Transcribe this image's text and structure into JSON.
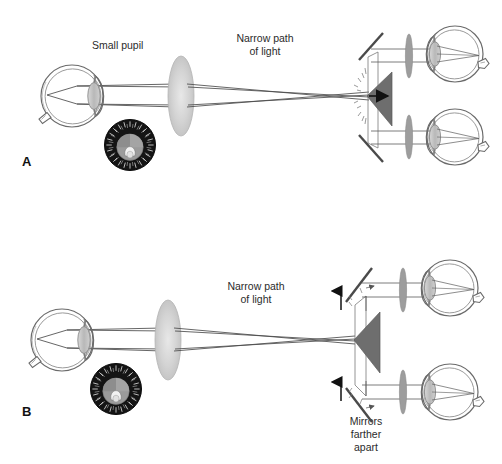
{
  "figure": {
    "background_color": "#ffffff",
    "ink_color": "#3a3a3a",
    "lens_fill": "#c9c9c9",
    "prism_fill": "#6e6e6e",
    "dial_fill": "#141414",
    "iris_fill": "#9b9b9b",
    "pupil_fill": "#f2f2f2"
  },
  "panels": [
    {
      "id": "A",
      "label": "A",
      "annotations": [
        {
          "name": "small-pupil",
          "text": "Small pupil",
          "lines": [
            "Small pupil"
          ]
        },
        {
          "name": "narrow-path-of-light",
          "text": "Narrow path of light",
          "lines": [
            "Narrow path",
            "of light"
          ]
        }
      ],
      "components": [
        {
          "name": "patient-eye",
          "label": "Patient eye"
        },
        {
          "name": "pupil-dial-inset",
          "label": "Pupil dial inset"
        },
        {
          "name": "condensing-lens",
          "label": "Condensing lens"
        },
        {
          "name": "prism",
          "label": "Prism"
        },
        {
          "name": "upper-mirror",
          "label": "Upper mirror"
        },
        {
          "name": "lower-mirror",
          "label": "Lower mirror"
        },
        {
          "name": "observer-eye-upper",
          "label": "Observer eye upper"
        },
        {
          "name": "observer-eye-lower",
          "label": "Observer eye lower"
        }
      ]
    },
    {
      "id": "B",
      "label": "B",
      "annotations": [
        {
          "name": "narrow-path-of-light",
          "text": "Narrow path of light",
          "lines": [
            "Narrow path",
            "of light"
          ]
        },
        {
          "name": "mirrors-farther-apart",
          "text": "Mirrors farther apart",
          "lines": [
            "Mirrors",
            "farther",
            "apart"
          ]
        }
      ],
      "components": [
        {
          "name": "patient-eye",
          "label": "Patient eye"
        },
        {
          "name": "pupil-dial-inset",
          "label": "Pupil dial inset"
        },
        {
          "name": "condensing-lens",
          "label": "Condensing lens"
        },
        {
          "name": "prism",
          "label": "Prism"
        },
        {
          "name": "upper-mirror",
          "label": "Upper mirror"
        },
        {
          "name": "lower-mirror",
          "label": "Lower mirror"
        },
        {
          "name": "separation-arrow-up",
          "label": "Separation arrow up"
        },
        {
          "name": "separation-arrow-down",
          "label": "Separation arrow down"
        },
        {
          "name": "observer-eye-upper",
          "label": "Observer eye upper"
        },
        {
          "name": "observer-eye-lower",
          "label": "Observer eye lower"
        }
      ]
    }
  ],
  "dial_numerals": [
    "I",
    "II",
    "III",
    "IIII",
    "V",
    "VI",
    "VII",
    "VIII",
    "IX",
    "X",
    "XI",
    "XII",
    "I",
    "II",
    "III",
    "IIII",
    "V",
    "VI",
    "VII",
    "VIII",
    "IX",
    "X",
    "XI",
    "XII"
  ]
}
